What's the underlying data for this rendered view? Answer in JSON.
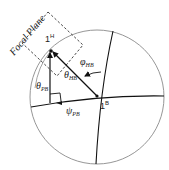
{
  "diagram": {
    "focal_plane_label": "Focal Plane",
    "points": {
      "head": {
        "label": "1",
        "superscript": "H"
      },
      "body": {
        "label": "1",
        "superscript": "B"
      }
    },
    "angles": {
      "phi_hb": {
        "symbol": "φ",
        "subscript": "HB"
      },
      "theta_hb": {
        "symbol": "θ",
        "subscript": "HB"
      },
      "theta_pb": {
        "symbol": "θ",
        "subscript": "PB"
      },
      "psi_pb": {
        "symbol": "ψ",
        "subscript": "PB"
      }
    },
    "colors": {
      "stroke": "#111111",
      "circle": "#888888",
      "dashed": "#333333",
      "text": "#222222"
    }
  }
}
